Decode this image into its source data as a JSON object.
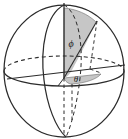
{
  "figure": {
    "kind": "spherical-coordinates-diagram",
    "background_color": "#ffffff",
    "line_color": "#2b2b2b",
    "shade_color": "#c6c6c6",
    "shade_edge_color": "#6b6b6b",
    "label_color": "#1a1a1a"
  },
  "sphere": {
    "center_x": 64,
    "center_y": 71,
    "radius_x": 60,
    "radius_y": 66,
    "outline_style": "solid"
  },
  "equator": {
    "name": "equatorial-ellipse",
    "center_x": 64,
    "center_y": 71,
    "radius_x": 60,
    "radius_y": 15,
    "front_style": "solid",
    "back_style": "dashed"
  },
  "meridian": {
    "name": "meridian-ellipse",
    "center_x": 64,
    "center_y": 71,
    "radius_x": 18,
    "radius_y": 66,
    "front_style": "solid",
    "back_style": "dashed"
  },
  "axes": [
    {
      "name": "z-axis",
      "orientation": "vertical",
      "x1": 64,
      "y1": 4,
      "x2": 64,
      "y2": 138,
      "style": "solid-with-dashed-back"
    },
    {
      "name": "x-axis",
      "orientation": "horizontal",
      "x1": 8,
      "y1": 78,
      "x2": 124,
      "y2": 64,
      "style": "solid"
    }
  ],
  "radius_vector": {
    "name": "radius-vector",
    "from_x": 64,
    "from_y": 78,
    "to_x": 96,
    "to_y": 22,
    "style": "solid"
  },
  "projection_lines": [
    {
      "name": "projection-to-equatorial-plane",
      "x1": 96,
      "y1": 22,
      "x2": 90,
      "y2": 68,
      "style": "dashed"
    },
    {
      "name": "projection-along-equator",
      "x1": 90,
      "y1": 68,
      "x2": 64,
      "y2": 78,
      "style": "dashed"
    }
  ],
  "shaded_regions": [
    {
      "name": "phi-wedge",
      "description": "vertical lune between z-axis and radius vector",
      "fill": "#c6c6c6",
      "opacity": 0.95
    },
    {
      "name": "theta-wedge",
      "description": "horizontal triangle in equatorial plane",
      "fill": "#c6c6c6",
      "opacity": 0.95
    }
  ],
  "labels": {
    "phi": {
      "name": "phi-angle-label",
      "text": "ϕ",
      "x": 72,
      "y": 45,
      "font_size": 10
    },
    "theta": {
      "name": "theta-angle-label",
      "text": "θ",
      "x": 75,
      "y": 84,
      "font_size": 9
    }
  }
}
